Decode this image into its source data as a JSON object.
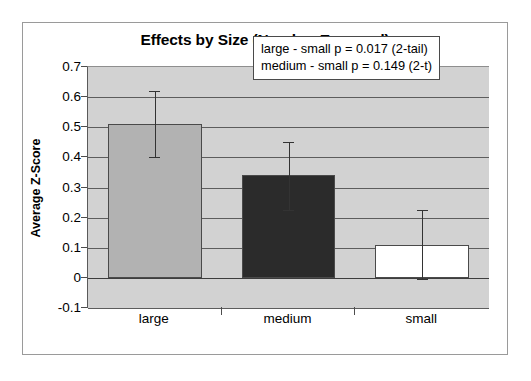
{
  "chart_data": {
    "type": "bar",
    "title": "Effects by Size (Number Engaged)",
    "xlabel": "",
    "ylabel": "Average Z-Score",
    "categories": [
      "large",
      "medium",
      "small"
    ],
    "values": [
      0.51,
      0.34,
      0.11
    ],
    "series": [
      {
        "name": "Average Z-Score",
        "values": [
          0.51,
          0.34,
          0.11
        ],
        "error_low": [
          0.4,
          0.225,
          -0.005
        ],
        "error_high": [
          0.62,
          0.45,
          0.225
        ],
        "bar_colors": [
          "#b2b2b2",
          "#2b2b2b",
          "#ffffff"
        ]
      }
    ],
    "ylim": [
      -0.1,
      0.7
    ],
    "ytick_labels": [
      "0.7",
      "0.6",
      "0.5",
      "0.4",
      "0.3",
      "0.2",
      "0.1",
      "0",
      "-0.1"
    ],
    "ytick_values": [
      0.7,
      0.6,
      0.5,
      0.4,
      0.3,
      0.2,
      0.1,
      0,
      -0.1
    ],
    "grid": true,
    "legend": "none",
    "plot_background": "#d2d2d2",
    "annotations": [
      "large - small p = 0.017 (2-tail)",
      "medium - small p = 0.149 (2-t)"
    ]
  },
  "annotation": {
    "line1": "large - small p = 0.017 (2-tail)",
    "line2": "medium - small p = 0.149 (2-t)"
  },
  "axes": {
    "y_title": "Average Z-Score"
  }
}
